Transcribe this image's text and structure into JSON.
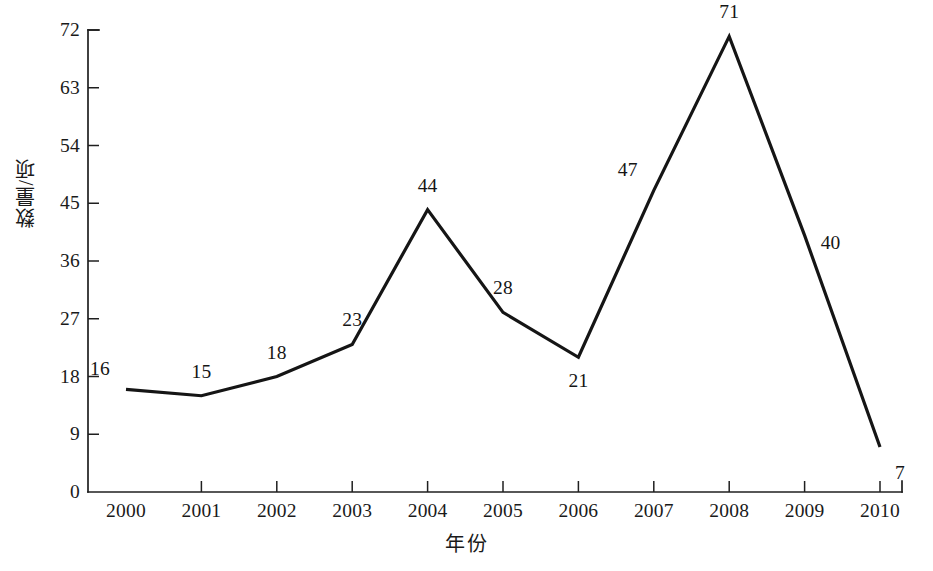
{
  "chart_data": {
    "type": "line",
    "title": "",
    "subtitle": "",
    "xlabel": "年份",
    "ylabel": "数量/项",
    "categories": [
      "2000",
      "2001",
      "2002",
      "2003",
      "2004",
      "2005",
      "2006",
      "2007",
      "2008",
      "2009",
      "2010"
    ],
    "x": [
      2000,
      2001,
      2002,
      2003,
      2004,
      2005,
      2006,
      2007,
      2008,
      2009,
      2010
    ],
    "values": [
      16,
      15,
      18,
      23,
      44,
      28,
      21,
      47,
      71,
      40,
      7
    ],
    "point_labels": [
      "16",
      "15",
      "18",
      "23",
      "44",
      "28",
      "21",
      "47",
      "71",
      "40",
      "7"
    ],
    "point_label_positions": [
      "above-left",
      "above",
      "above",
      "above",
      "above",
      "above",
      "below",
      "above-left",
      "above",
      "right",
      "below-right"
    ],
    "series": [
      {
        "name": "数量/项",
        "values": [
          16,
          15,
          18,
          23,
          44,
          28,
          21,
          47,
          71,
          40,
          7
        ],
        "color": "#151515"
      }
    ],
    "ylim": [
      0,
      72
    ],
    "ytick_values": [
      0,
      9,
      18,
      27,
      36,
      45,
      54,
      63,
      72
    ],
    "ytick_labels": [
      "0",
      "9",
      "18",
      "27",
      "36",
      "45",
      "54",
      "63",
      "72"
    ],
    "ytick_step": 9,
    "xtick_labels": [
      "2000",
      "2001",
      "2002",
      "2003",
      "2004",
      "2005",
      "2006",
      "2007",
      "2008",
      "2009",
      "2010"
    ],
    "grid": false,
    "legend": false,
    "legend_position": "none",
    "markers": false,
    "line_color": "#151515",
    "axis_color": "#1f1f1f",
    "background_color": "#ffffff"
  },
  "axes": {
    "y_title": "数量/项",
    "x_title": "年份"
  }
}
